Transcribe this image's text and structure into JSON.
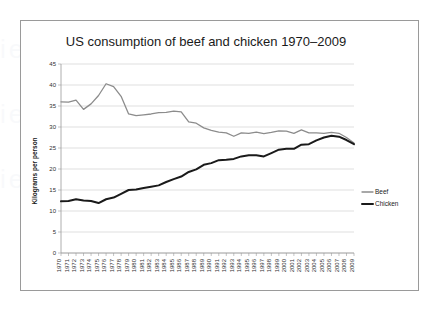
{
  "figure": {
    "title": "US consumption of beef and chicken 1970–2009",
    "border_color": "#9a9a9a",
    "background": "#ffffff"
  },
  "chart_data": {
    "type": "line",
    "title": "US consumption of beef and chicken 1970–2009",
    "xlabel": "",
    "ylabel": "Kilograms per person",
    "ylim": [
      0,
      45
    ],
    "ytick_step": 5,
    "yticks": [
      0,
      5,
      10,
      15,
      20,
      25,
      30,
      35,
      40,
      45
    ],
    "grid": true,
    "grid_axis": "y",
    "legend_position": "right",
    "categories": [
      "1970",
      "1971",
      "1972",
      "1973",
      "1974",
      "1975",
      "1976",
      "1977",
      "1978",
      "1979",
      "1980",
      "1981",
      "1982",
      "1983",
      "1984",
      "1985",
      "1986",
      "1987",
      "1988",
      "1989",
      "1990",
      "1991",
      "1992",
      "1993",
      "1994",
      "1995",
      "1996",
      "1997",
      "1998",
      "1999",
      "2000",
      "2001",
      "2002",
      "2003",
      "2004",
      "2005",
      "2006",
      "2007",
      "2008",
      "2009"
    ],
    "series": [
      {
        "name": "Beef",
        "color": "#8c8c8c",
        "stroke_width": 1.3,
        "values": [
          36.0,
          35.9,
          36.4,
          34.2,
          35.5,
          37.5,
          40.3,
          39.6,
          37.3,
          33.1,
          32.7,
          32.9,
          33.1,
          33.4,
          33.5,
          33.8,
          33.6,
          31.2,
          30.9,
          29.8,
          29.2,
          28.8,
          28.6,
          27.8,
          28.6,
          28.5,
          28.8,
          28.4,
          28.7,
          29.1,
          29.0,
          28.5,
          29.3,
          28.6,
          28.6,
          28.5,
          28.7,
          28.5,
          27.5,
          26.2
        ]
      },
      {
        "name": "Chicken",
        "color": "#1a1a1a",
        "stroke_width": 2.0,
        "values": [
          12.3,
          12.4,
          12.8,
          12.5,
          12.4,
          11.9,
          12.8,
          13.2,
          14.1,
          15.0,
          15.1,
          15.5,
          15.8,
          16.1,
          16.9,
          17.6,
          18.2,
          19.3,
          19.9,
          21.0,
          21.4,
          22.1,
          22.2,
          22.4,
          23.0,
          23.3,
          23.3,
          23.0,
          23.8,
          24.6,
          24.8,
          24.8,
          25.8,
          25.9,
          26.8,
          27.5,
          27.9,
          27.7,
          26.9,
          25.9
        ]
      }
    ]
  },
  "legend": {
    "items": [
      {
        "label": "Beef",
        "color": "#8c8c8c",
        "stroke_width": 1.3
      },
      {
        "label": "Chicken",
        "color": "#1a1a1a",
        "stroke_width": 2.0
      }
    ]
  }
}
